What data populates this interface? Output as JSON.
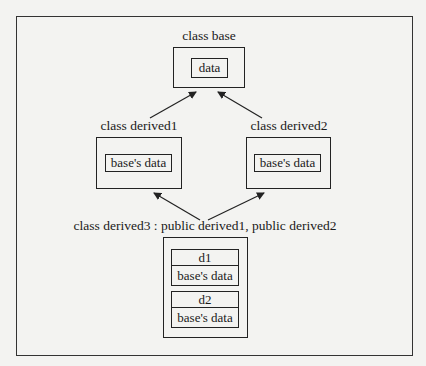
{
  "diagram": {
    "base": {
      "title": "class base",
      "member": "data"
    },
    "derived1": {
      "title": "class derived1",
      "member": "base's data"
    },
    "derived2": {
      "title": "class derived2",
      "member": "base's data"
    },
    "derived3": {
      "title": "class derived3 : public derived1, public derived2",
      "subobjects": [
        {
          "name": "d1",
          "member": "base's data"
        },
        {
          "name": "d2",
          "member": "base's data"
        }
      ]
    },
    "edges": [
      {
        "from": "derived1",
        "to": "base"
      },
      {
        "from": "derived2",
        "to": "base"
      },
      {
        "from": "derived3",
        "to": "derived1"
      },
      {
        "from": "derived3",
        "to": "derived2"
      }
    ]
  }
}
